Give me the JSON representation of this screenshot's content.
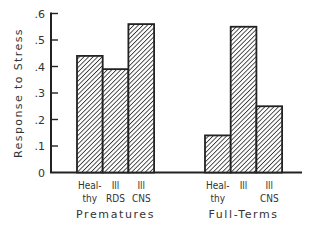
{
  "chart_data": {
    "type": "bar",
    "title": "",
    "xlabel": "",
    "ylabel": "Response to Stress",
    "ylim": [
      0,
      0.6
    ],
    "yticks": [
      0,
      0.1,
      0.2,
      0.3,
      0.4,
      0.5,
      0.6
    ],
    "ytick_labels": [
      "0",
      ".1",
      ".2",
      ".3",
      ".4",
      ".5",
      ".6"
    ],
    "grid": false,
    "legend": null,
    "groups": [
      {
        "name": "Prematures",
        "bars": [
          {
            "label": [
              "Heal-",
              "thy"
            ],
            "category": "Healthy",
            "value": 0.44
          },
          {
            "label": [
              "Ill",
              "RDS"
            ],
            "category": "Ill RDS",
            "value": 0.39
          },
          {
            "label": [
              "Ill",
              "CNS"
            ],
            "category": "Ill CNS",
            "value": 0.56
          }
        ]
      },
      {
        "name": "Full-Terms",
        "bars": [
          {
            "label": [
              "Heal-",
              "thy"
            ],
            "category": "Healthy",
            "value": 0.14
          },
          {
            "label": [
              "Ill",
              ""
            ],
            "category": "Ill",
            "value": 0.55
          },
          {
            "label": [
              "Ill",
              "CNS"
            ],
            "category": "Ill CNS",
            "value": 0.25
          }
        ]
      }
    ],
    "bar_fill": "diagonal-hatch",
    "colors": {
      "stroke": "#222222",
      "hatch": "#333333",
      "background": "#ffffff"
    }
  }
}
